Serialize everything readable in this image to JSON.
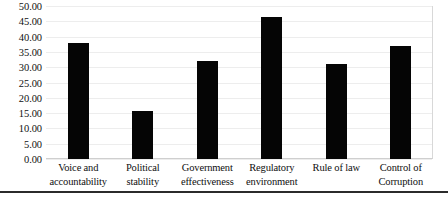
{
  "chart_data": {
    "type": "bar",
    "title": "",
    "subtitle": "",
    "xlabel": "",
    "ylabel": "",
    "categories": [
      "Voice and accountability",
      "Political stability",
      "Government effectiveness",
      "Regulatory environment",
      "Rule of law",
      "Control of Corruption"
    ],
    "category_lines": [
      [
        "Voice and",
        "accountability"
      ],
      [
        "Political",
        "stability"
      ],
      [
        "Government",
        "effectiveness"
      ],
      [
        "Regulatory",
        "environment"
      ],
      [
        "Rule of law",
        ""
      ],
      [
        "Control of",
        "Corruption"
      ]
    ],
    "values": [
      38.0,
      15.8,
      32.0,
      46.3,
      31.0,
      37.0
    ],
    "ylim": [
      0,
      50
    ],
    "y_tick_step": 5,
    "y_tick_labels": [
      "50.00",
      "45.00",
      "40.00",
      "35.00",
      "30.00",
      "25.00",
      "20.00",
      "15.00",
      "10.00",
      "5.00",
      "0.00"
    ],
    "y_tick_values": [
      50,
      45,
      40,
      35,
      30,
      25,
      20,
      15,
      10,
      5,
      0
    ],
    "grid": true,
    "legend": false,
    "legend_position": "none",
    "bar_color": "#050505",
    "grid_color": "#ededed",
    "background_color": "#ffffff"
  }
}
